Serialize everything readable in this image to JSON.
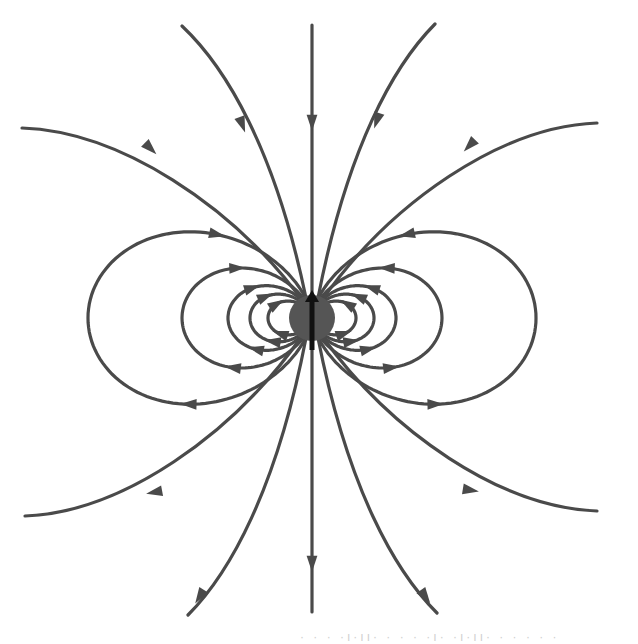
{
  "diagram": {
    "center": {
      "x": 312,
      "y": 318
    },
    "sphere": {
      "radius": 23,
      "color": "#555555"
    },
    "dipole_arrow": {
      "direction": "up",
      "color": "#111111",
      "y_top": 290,
      "y_bottom": 350
    },
    "line_color": "#4a4a4a",
    "closed_loops": {
      "note": "r = L * sin^2(theta); both sides; arrows point back toward the dipole (top-left/top-right on the upper arc, outward on the lower arc)",
      "L_values": [
        44,
        62,
        84,
        130,
        224
      ],
      "arrow_positions_fraction": [
        0.72,
        0.72,
        0.72,
        0.75,
        0.78
      ]
    },
    "open_lines": [
      {
        "name": "vertical-top",
        "points": [
          [
            312,
            25
          ],
          [
            312,
            296
          ]
        ],
        "arrow_at": [
          312,
          122
        ],
        "arrow_dir": "down"
      },
      {
        "name": "vertical-bottom",
        "points": [
          [
            312,
            340
          ],
          [
            312,
            612
          ]
        ],
        "arrow_at": [
          312,
          563
        ],
        "arrow_dir": "down"
      },
      {
        "name": "upper-left-steep",
        "from": [
          182,
          26
        ],
        "to": [
          306,
          298
        ],
        "arrow_at": [
          242,
          124
        ]
      },
      {
        "name": "upper-right-steep",
        "from": [
          435,
          24
        ],
        "to": [
          318,
          298
        ],
        "arrow_at": [
          377,
          120
        ]
      },
      {
        "name": "upper-left-wide",
        "from": [
          22,
          128
        ],
        "to": [
          302,
          300
        ],
        "arrow_at": [
          150,
          148
        ]
      },
      {
        "name": "upper-right-wide",
        "from": [
          597,
          123
        ],
        "to": [
          322,
          300
        ],
        "arrow_at": [
          470,
          145
        ]
      },
      {
        "name": "lower-left-wide",
        "from": [
          25,
          516
        ],
        "to": [
          302,
          336
        ],
        "arrow_at": [
          155,
          492
        ]
      },
      {
        "name": "lower-right-wide",
        "from": [
          597,
          511
        ],
        "to": [
          322,
          336
        ],
        "arrow_at": [
          470,
          490
        ]
      },
      {
        "name": "lower-left-steep",
        "from": [
          188,
          615
        ],
        "to": [
          306,
          338
        ],
        "arrow_at": [
          200,
          596
        ]
      },
      {
        "name": "lower-right-steep",
        "from": [
          437,
          613
        ],
        "to": [
          318,
          338
        ],
        "arrow_at": [
          425,
          596
        ]
      }
    ],
    "caption_fragment": "· · · ·ı·ıı· · · · ·ı· ·ı·ıı· · · · · ·"
  }
}
